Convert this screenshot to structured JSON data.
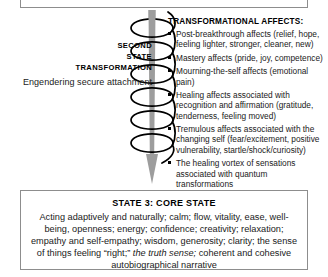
{
  "diagram": {
    "top_box": {
      "visible_text": ""
    },
    "left_labels": {
      "line1": "SECOND",
      "line2": "STATE",
      "line3": "TRANSFORMATION",
      "subtitle": "Engendering secure attachment"
    },
    "spiral": {
      "name": "downward-spiral-arrow",
      "arrow_color": "#9a9a9a",
      "coil_color": "#000000",
      "coil_count": 6,
      "direction": "downward"
    },
    "affects": {
      "title": "TRANSFORMATIONAL AFFECTS:",
      "items": [
        "Post-breakthrough affects (relief, hope, feeling lighter, stronger, cleaner, new)",
        "Mastery affects (pride, joy, competence)",
        "Mourning-the-self affects (emotional pain)",
        "Healing affects associated with recognition and affirmation (gratitude, tenderness, feeling moved)",
        "Tremulous affects associated with the changing self (fear/excitement, positive vulnerability, startle/shock/curiosity)",
        "The healing vortex of sensations associated with quantum transformations"
      ]
    },
    "core_state": {
      "title": "STATE 3: CORE STATE",
      "body_part1": "Acting adaptively and naturally; calm; flow, vitality, ease, well-being, openness; energy; confidence; creativity; relaxation; empathy and self-empathy; wisdom, generosity; clarity; the sense of things feeling “right;” ",
      "body_italic": "the truth sense;",
      "body_part2": " coherent and cohesive autobiographical narrative"
    }
  }
}
